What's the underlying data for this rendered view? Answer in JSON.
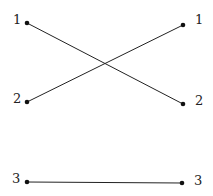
{
  "diagram": {
    "type": "bipartite-matching",
    "left_nodes": [
      {
        "label": "1",
        "x": 27,
        "y": 23
      },
      {
        "label": "2",
        "x": 27,
        "y": 102
      },
      {
        "label": "3",
        "x": 27,
        "y": 182
      }
    ],
    "right_nodes": [
      {
        "label": "1",
        "x": 183,
        "y": 25
      },
      {
        "label": "2",
        "x": 183,
        "y": 104
      },
      {
        "label": "3",
        "x": 182,
        "y": 183
      }
    ],
    "edges": [
      {
        "from": "L1",
        "to": "R2"
      },
      {
        "from": "L2",
        "to": "R1"
      },
      {
        "from": "L3",
        "to": "R3"
      }
    ],
    "colors": {
      "line": "#222222",
      "node": "#111111",
      "background": "#ffffff"
    }
  }
}
